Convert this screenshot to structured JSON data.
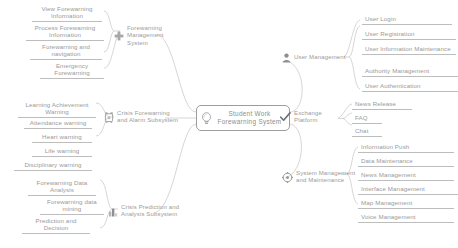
{
  "diagram": {
    "type": "mindmap",
    "title": "Student Work Forewarning System",
    "center": {
      "label": "Student Work Forewarning System",
      "icon": "lightbulb-icon"
    },
    "branches": [
      {
        "id": "forewarning-management-system",
        "label": "Forewarning Management System",
        "icon": "plus-icon",
        "side": "left",
        "children": [
          {
            "label": "View Forewarning Information"
          },
          {
            "label": "Process Forewarning Information"
          },
          {
            "label": "Forewarning and navigation"
          },
          {
            "label": "Emergency Forewarning"
          }
        ]
      },
      {
        "id": "crisis-forewarning-and-alarm-subsystem",
        "label": "Crisis Forewarning and Alarm Subsystem",
        "icon": "alarm-clock-icon",
        "side": "left",
        "children": [
          {
            "label": "Learning Achievement Warning"
          },
          {
            "label": "Attendance warning"
          },
          {
            "label": "Heart warning"
          },
          {
            "label": "Life warning"
          },
          {
            "label": "Disciplinary warning"
          }
        ]
      },
      {
        "id": "crisis-prediction-and-analysis-subsystem",
        "label": "Crisis Prediction and Analysis Subsystem",
        "icon": "bar-chart-icon",
        "side": "left",
        "children": [
          {
            "label": "Forewarning Data Analysis"
          },
          {
            "label": "Forewarning data mining"
          },
          {
            "label": "Prediction and Decision"
          }
        ]
      },
      {
        "id": "user-management",
        "label": "User Management",
        "icon": "user-icon",
        "side": "right",
        "children": [
          {
            "label": "User Login"
          },
          {
            "label": "User Registration"
          },
          {
            "label": "User Information Maintenance"
          },
          {
            "label": "Authority Management"
          },
          {
            "label": "User Authentication"
          }
        ]
      },
      {
        "id": "exchange-platform",
        "label": "Exchange Platform",
        "icon": "check-icon",
        "side": "right",
        "children": [
          {
            "label": "News Release"
          },
          {
            "label": "FAQ"
          },
          {
            "label": "Chat"
          }
        ]
      },
      {
        "id": "system-management-and-maintenance",
        "label": "System Management and Maintenance",
        "icon": "gear-icon",
        "side": "right",
        "children": [
          {
            "label": "Information Push"
          },
          {
            "label": "Data Maintenance"
          },
          {
            "label": "News Management"
          },
          {
            "label": "Interface Management"
          },
          {
            "label": "Map Management"
          },
          {
            "label": "Voice Management"
          }
        ]
      }
    ],
    "colors": {
      "line": "#bdbdbd",
      "text": "#9a9a9a",
      "text_strong": "#6f6f6f",
      "background": "#ffffff"
    }
  }
}
